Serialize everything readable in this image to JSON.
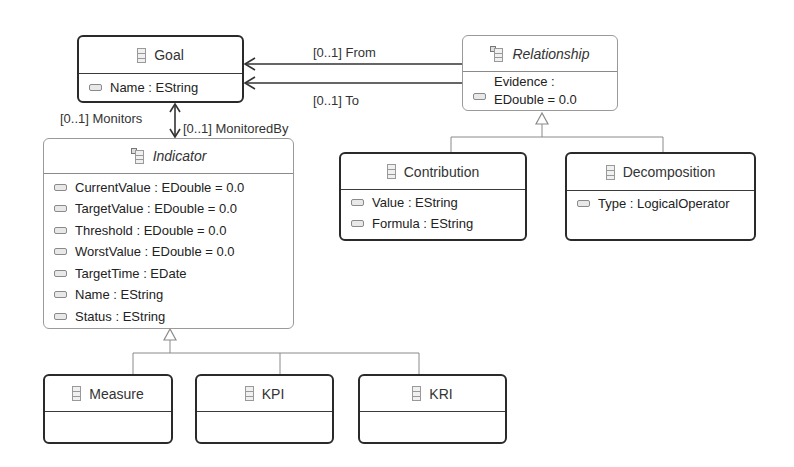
{
  "diagram": {
    "type": "Ecore class diagram",
    "classes": {
      "goal": {
        "name": "Goal",
        "abstract": false,
        "attributes": [
          {
            "label": "Name : EString"
          }
        ]
      },
      "relationship": {
        "name": "Relationship",
        "abstract": true,
        "attributes": [
          {
            "label_line1": "Evidence :",
            "label_line2": "EDouble = 0.0"
          }
        ]
      },
      "indicator": {
        "name": "Indicator",
        "abstract": true,
        "attributes": [
          {
            "label": "CurrentValue : EDouble = 0.0"
          },
          {
            "label": "TargetValue : EDouble = 0.0"
          },
          {
            "label": "Threshold : EDouble = 0.0"
          },
          {
            "label": "WorstValue : EDouble = 0.0"
          },
          {
            "label": "TargetTime : EDate"
          },
          {
            "label": "Name : EString"
          },
          {
            "label": "Status : EString"
          }
        ]
      },
      "contribution": {
        "name": "Contribution",
        "abstract": false,
        "attributes": [
          {
            "label": "Value : EString"
          },
          {
            "label": "Formula : EString"
          }
        ]
      },
      "decomposition": {
        "name": "Decomposition",
        "abstract": false,
        "attributes": [
          {
            "label": "Type : LogicalOperator"
          }
        ]
      },
      "measure": {
        "name": "Measure",
        "abstract": false,
        "attributes": []
      },
      "kpi": {
        "name": "KPI",
        "abstract": false,
        "attributes": []
      },
      "kri": {
        "name": "KRI",
        "abstract": false,
        "attributes": []
      }
    },
    "references": {
      "from": {
        "label": "[0..1] From",
        "source": "Relationship",
        "target": "Goal"
      },
      "to": {
        "label": "[0..1] To",
        "source": "Relationship",
        "target": "Goal"
      },
      "monitors": {
        "label": "[0..1] Monitors",
        "source": "Indicator",
        "target": "Goal"
      },
      "monitored_by": {
        "label": "[0..1] MonitoredBy",
        "source": "Goal",
        "target": "Indicator"
      }
    },
    "generalizations": [
      {
        "parent": "Relationship",
        "children": [
          "Contribution",
          "Decomposition"
        ]
      },
      {
        "parent": "Indicator",
        "children": [
          "Measure",
          "KPI",
          "KRI"
        ]
      }
    ],
    "colors": {
      "concrete_border": "#2a2a2a",
      "abstract_border": "#9a9a9a",
      "edge": "#333333",
      "inheritance_edge": "#8a8a8a",
      "background": "#ffffff"
    }
  }
}
